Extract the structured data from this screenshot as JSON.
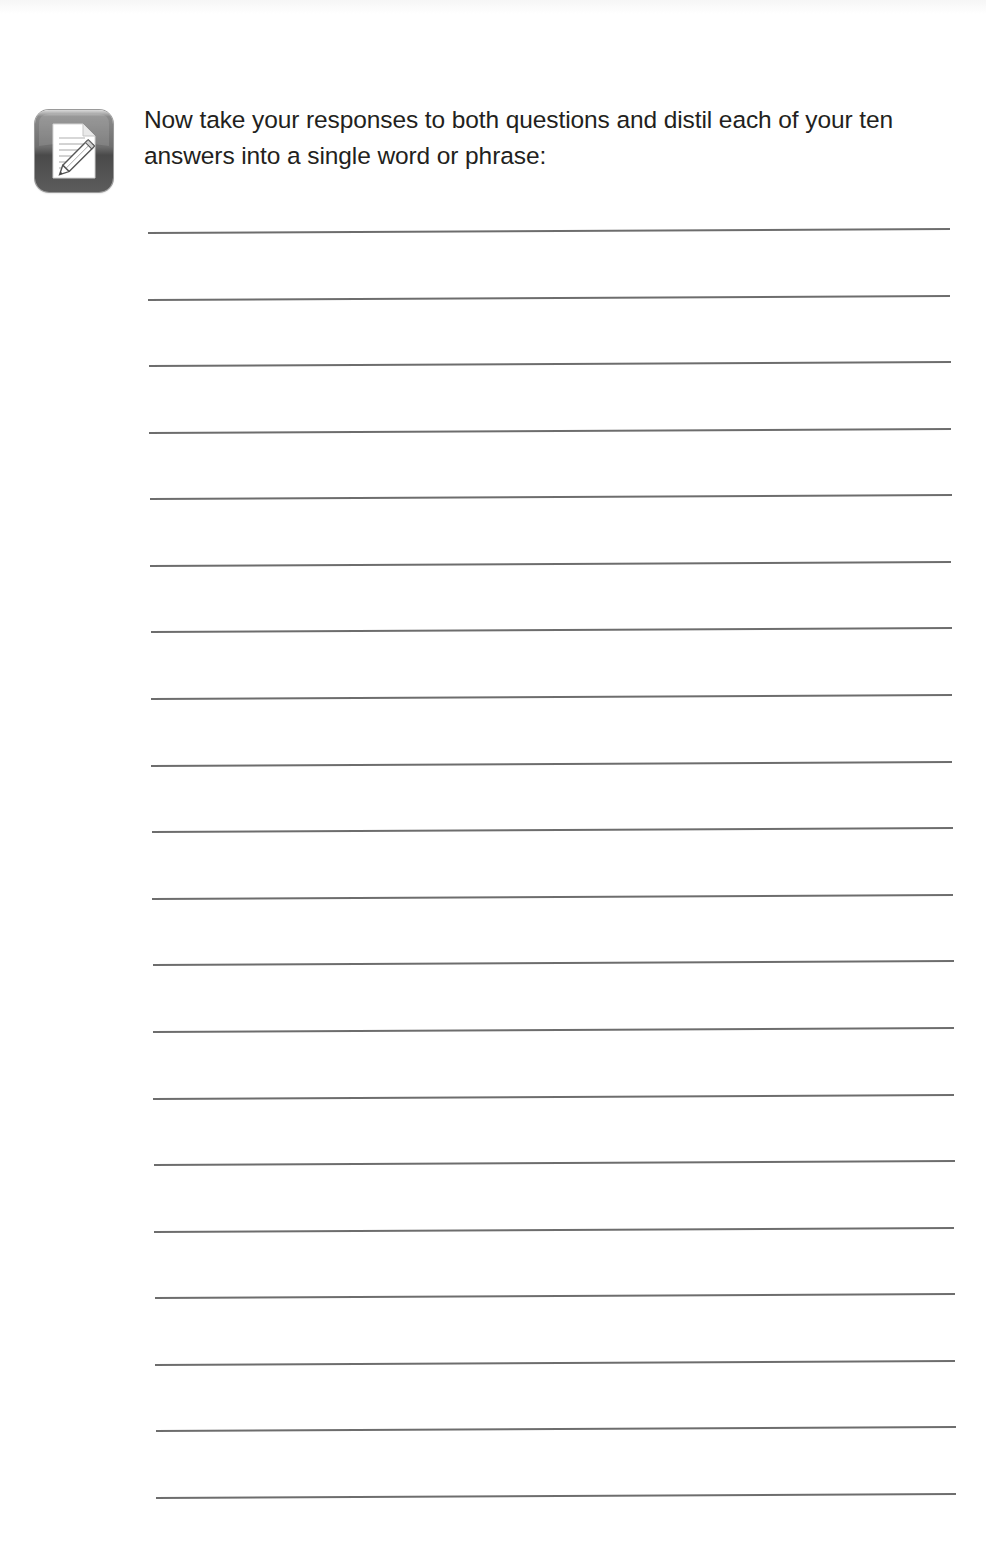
{
  "page": {
    "background": "#ffffff",
    "text_color": "#231f20",
    "line_color": "#6d6d6d"
  },
  "exercise": {
    "icon": "notepad-pencil-icon",
    "prompt": "Now take your responses to both questions and distil each of your ten answers into a single word or phrase:",
    "line_count": 20
  },
  "writing_lines": [
    {
      "index": 1,
      "value": ""
    },
    {
      "index": 2,
      "value": ""
    },
    {
      "index": 3,
      "value": ""
    },
    {
      "index": 4,
      "value": ""
    },
    {
      "index": 5,
      "value": ""
    },
    {
      "index": 6,
      "value": ""
    },
    {
      "index": 7,
      "value": ""
    },
    {
      "index": 8,
      "value": ""
    },
    {
      "index": 9,
      "value": ""
    },
    {
      "index": 10,
      "value": ""
    },
    {
      "index": 11,
      "value": ""
    },
    {
      "index": 12,
      "value": ""
    },
    {
      "index": 13,
      "value": ""
    },
    {
      "index": 14,
      "value": ""
    },
    {
      "index": 15,
      "value": ""
    },
    {
      "index": 16,
      "value": ""
    },
    {
      "index": 17,
      "value": ""
    },
    {
      "index": 18,
      "value": ""
    },
    {
      "index": 19,
      "value": ""
    },
    {
      "index": 20,
      "value": ""
    }
  ]
}
